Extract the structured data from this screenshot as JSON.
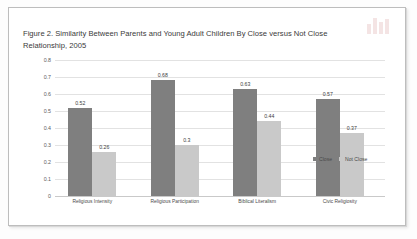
{
  "figure": {
    "title_line1": "Figure 2. Similarity Between Parents and Young Adult Children By Close versus Not Close",
    "title_line2": "Relationship, 2005"
  },
  "chart_data": {
    "type": "bar",
    "title": "Figure 2. Similarity Between Parents and Young Adult Children By Close versus Not Close Relationship, 2005",
    "xlabel": "",
    "ylabel": "",
    "ylim": [
      0,
      0.8
    ],
    "ytick_labels": [
      "0.8",
      "0.7",
      "0.6",
      "0.5",
      "0.4",
      "0.3",
      "0.2",
      "0.1",
      "0"
    ],
    "ytick_values": [
      0.8,
      0.7,
      0.6,
      0.5,
      0.4,
      0.3,
      0.2,
      0.1,
      0
    ],
    "grid": true,
    "legend_position": "inside-right",
    "categories": [
      "Religious Intensity",
      "Religious Participation",
      "Biblical Literalism",
      "Civic Religiosity"
    ],
    "series": [
      {
        "name": "Close",
        "color": "#7f7f7f",
        "values": [
          0.52,
          0.68,
          0.63,
          0.57
        ],
        "labels": [
          "0.52",
          "0.68",
          "0.63",
          "0.57"
        ]
      },
      {
        "name": "Not Close",
        "color": "#c9c9c9",
        "values": [
          0.26,
          0.3,
          0.44,
          0.37
        ],
        "labels": [
          "0.26",
          "0.3",
          "0.44",
          "0.37"
        ]
      }
    ]
  }
}
